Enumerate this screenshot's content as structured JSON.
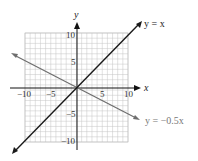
{
  "chart_data": {
    "type": "line",
    "title": "",
    "xlabel": "x",
    "ylabel": "y",
    "xlim": [
      -10,
      10
    ],
    "ylim": [
      -10,
      10
    ],
    "grid": true,
    "x_ticks": [
      "−10",
      "−5",
      "5",
      "10"
    ],
    "y_ticks": [
      "10",
      "5",
      "−5",
      "−10"
    ],
    "series": [
      {
        "name": "y = x",
        "equation": "y = x",
        "slope": 1,
        "color": "#1a1a1a",
        "x": [
          -12.7,
          12.7
        ],
        "y": [
          -12.7,
          12.7
        ]
      },
      {
        "name": "y = −0.5x",
        "equation": "y = −0.5x",
        "slope": -0.5,
        "color": "#6e6e6e",
        "x": [
          -13,
          12.6
        ],
        "y": [
          6.5,
          -6.3
        ]
      }
    ]
  },
  "labels": {
    "x_axis": "x",
    "y_axis": "y",
    "line1": "y = x",
    "line2": "y = −0.5x",
    "tick_x_neg10": "−10",
    "tick_x_neg5": "−5",
    "tick_x_5": "5",
    "tick_x_10": "10",
    "tick_y_10": "10",
    "tick_y_5": "5",
    "tick_y_neg5": "−5",
    "tick_y_neg10": "−10"
  }
}
